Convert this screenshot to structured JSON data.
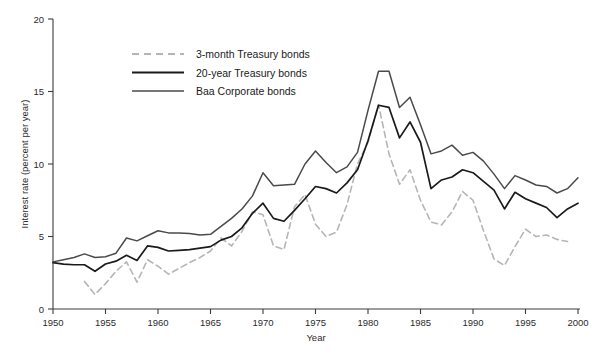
{
  "chart_data": {
    "type": "line",
    "title": "",
    "xlabel": "Year",
    "ylabel": "Interest rate (percent per year)",
    "xlim": [
      1950,
      2000
    ],
    "ylim": [
      0,
      20
    ],
    "xticks": [
      1950,
      1955,
      1960,
      1965,
      1970,
      1975,
      1980,
      1985,
      1990,
      1995,
      2000
    ],
    "yticks": [
      0,
      5,
      10,
      15,
      20
    ],
    "grid": false,
    "legend_position": "upper-left-inside",
    "series": [
      {
        "name": "3-month Treasury bonds",
        "style": "dashed",
        "color": "#b5b5b5",
        "x": [
          1953,
          1954,
          1955,
          1956,
          1957,
          1958,
          1959,
          1960,
          1961,
          1962,
          1963,
          1964,
          1965,
          1966,
          1967,
          1968,
          1969,
          1970,
          1971,
          1972,
          1973,
          1974,
          1975,
          1976,
          1977,
          1978,
          1979,
          1980,
          1981,
          1982,
          1983,
          1984,
          1985,
          1986,
          1987,
          1988,
          1989,
          1990,
          1991,
          1992,
          1993,
          1994,
          1995,
          1996,
          1997,
          1998,
          1999
        ],
        "values": [
          1.9,
          1.0,
          1.75,
          2.6,
          3.25,
          1.85,
          3.4,
          2.95,
          2.4,
          2.8,
          3.2,
          3.55,
          4.0,
          4.9,
          4.35,
          5.35,
          6.7,
          6.5,
          4.35,
          4.1,
          7.05,
          7.9,
          5.85,
          5.0,
          5.3,
          7.2,
          10.0,
          11.5,
          14.1,
          10.7,
          8.6,
          9.6,
          7.5,
          6.0,
          5.8,
          6.7,
          8.1,
          7.5,
          5.4,
          3.45,
          3.0,
          4.3,
          5.5,
          5.0,
          5.1,
          4.8,
          4.65
        ],
        "note": "Light gray dashed line; begins about 1953 and ends about 1999"
      },
      {
        "name": "20-year Treasury bonds",
        "style": "solid",
        "color": "#1a1a1a",
        "x": [
          1950,
          1951,
          1952,
          1953,
          1954,
          1955,
          1956,
          1957,
          1958,
          1959,
          1960,
          1961,
          1962,
          1963,
          1964,
          1965,
          1966,
          1967,
          1968,
          1969,
          1970,
          1971,
          1972,
          1973,
          1974,
          1975,
          1976,
          1977,
          1978,
          1979,
          1980,
          1981,
          1982,
          1983,
          1984,
          1985,
          1986,
          1987,
          1988,
          1989,
          1990,
          1991,
          1992,
          1993,
          1994,
          1995,
          1996,
          1997,
          1998,
          1999,
          2000
        ],
        "values": [
          3.2,
          3.1,
          3.05,
          3.05,
          2.6,
          3.1,
          3.3,
          3.7,
          3.35,
          4.35,
          4.25,
          4.0,
          4.05,
          4.1,
          4.2,
          4.3,
          4.75,
          5.0,
          5.6,
          6.6,
          7.3,
          6.25,
          6.05,
          6.8,
          7.6,
          8.45,
          8.3,
          8.0,
          8.7,
          9.6,
          11.6,
          14.05,
          13.9,
          11.8,
          12.9,
          11.5,
          8.3,
          8.9,
          9.1,
          9.6,
          9.4,
          8.8,
          8.2,
          6.9,
          8.05,
          7.6,
          7.3,
          7.0,
          6.3,
          6.9,
          7.3
        ],
        "note": "Black solid line, heavier stroke"
      },
      {
        "name": "Baa Corporate bonds",
        "style": "solid",
        "color": "#4a4a4a",
        "x": [
          1950,
          1951,
          1952,
          1953,
          1954,
          1955,
          1956,
          1957,
          1958,
          1959,
          1960,
          1961,
          1962,
          1963,
          1964,
          1965,
          1966,
          1967,
          1968,
          1969,
          1970,
          1971,
          1972,
          1973,
          1974,
          1975,
          1976,
          1977,
          1978,
          1979,
          1980,
          1981,
          1982,
          1983,
          1984,
          1985,
          1986,
          1987,
          1988,
          1989,
          1990,
          1991,
          1992,
          1993,
          1994,
          1995,
          1996,
          1997,
          1998,
          1999,
          2000
        ],
        "values": [
          3.25,
          3.4,
          3.55,
          3.8,
          3.55,
          3.6,
          3.85,
          4.9,
          4.7,
          5.05,
          5.4,
          5.25,
          5.25,
          5.2,
          5.1,
          5.15,
          5.7,
          6.25,
          6.9,
          7.8,
          9.4,
          8.5,
          8.55,
          8.6,
          10.0,
          10.9,
          10.1,
          9.4,
          9.8,
          10.8,
          13.7,
          16.4,
          16.4,
          13.9,
          14.6,
          12.7,
          10.7,
          10.9,
          11.3,
          10.6,
          10.8,
          10.2,
          9.3,
          8.3,
          9.2,
          8.9,
          8.55,
          8.45,
          8.0,
          8.3,
          9.05
        ],
        "note": "Dark gray solid line, uppermost series"
      }
    ]
  },
  "legend": {
    "entries": [
      {
        "label": "3-month Treasury bonds",
        "style": "dashed",
        "color": "#b5b5b5"
      },
      {
        "label": "20-year Treasury bonds",
        "style": "solid",
        "color": "#1a1a1a"
      },
      {
        "label": "Baa Corporate bonds",
        "style": "solid",
        "color": "#4a4a4a"
      }
    ]
  },
  "axes": {
    "y_title": "Interest rate (percent per year)",
    "x_title": "Year",
    "y_tick_labels": [
      "0",
      "5",
      "10",
      "15",
      "20"
    ],
    "x_tick_labels": [
      "1950",
      "1955",
      "1960",
      "1965",
      "1970",
      "1975",
      "1980",
      "1985",
      "1990",
      "1995",
      "2000"
    ]
  },
  "footer": {
    "cut_off_caption": ""
  }
}
